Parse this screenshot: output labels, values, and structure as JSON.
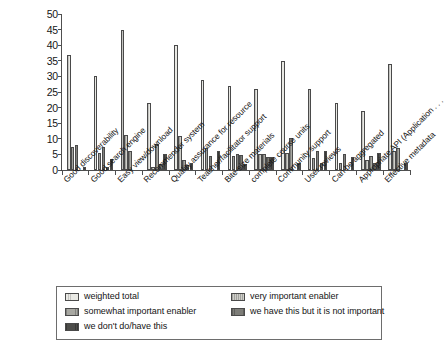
{
  "chart_data": {
    "type": "bar",
    "title": "",
    "subtitle": "",
    "xlabel": "",
    "ylabel": "",
    "ylim": [
      0,
      50
    ],
    "ytick_step": 5,
    "yticks": [
      0,
      5,
      10,
      15,
      20,
      25,
      30,
      35,
      40,
      45,
      50
    ],
    "ytick_labels": [
      "0",
      "5",
      "10",
      "15",
      "20",
      "25",
      "30",
      "35",
      "40",
      "45",
      "50"
    ],
    "grid": false,
    "legend_position": "bottom",
    "categories": [
      "Good discoverability",
      "Good search engine",
      "Easy view/download",
      "Recommender system",
      "Quality assurance for resource",
      "Teacher/facilitator support",
      "Bite-size materials",
      "complete course units",
      "Community support",
      "User reviews",
      "Can be aggregated",
      "Appropriate API (Application . . .",
      "Effective metadata"
    ],
    "series": [
      {
        "name": "weighted total",
        "color": "#e9e9e4",
        "values": [
          37,
          30,
          45,
          21.5,
          40,
          29,
          27,
          26,
          35,
          26,
          21.5,
          19,
          34
        ]
      },
      {
        "name": "very important enabler",
        "color": "#cfcfc9",
        "values": [
          7.5,
          5.3,
          11.3,
          1,
          10.8,
          7,
          4.5,
          5.2,
          5.3,
          4,
          2.3,
          3.2,
          6.2
        ]
      },
      {
        "name": "somewhat important enabler",
        "color": "#a8a8a2",
        "values": [
          8,
          7.4,
          6,
          8.2,
          3.3,
          4.5,
          5.2,
          5,
          10.2,
          6,
          5.2,
          4.5,
          7
        ]
      },
      {
        "name": "we have this but it is not important",
        "color": "#7d7d78",
        "values": [
          0,
          1,
          0,
          2,
          1.5,
          0,
          4.8,
          4.2,
          0,
          2.3,
          0,
          2.2,
          0
        ]
      },
      {
        "name": "we don't do/have this",
        "color": "#4d4d4a",
        "values": [
          1,
          3.5,
          0,
          5,
          2.2,
          6,
          2,
          4.3,
          2.2,
          6,
          4.2,
          5.3,
          2.2
        ]
      }
    ]
  },
  "legend": {
    "entries": [
      {
        "label": "weighted total",
        "color": "#e9e9e4"
      },
      {
        "label": "very important enabler",
        "color": "#cfcfc9"
      },
      {
        "label": "somewhat important enabler",
        "color": "#a8a8a2"
      },
      {
        "label": "we have this but it is not important",
        "color": "#7d7d78"
      },
      {
        "label": "we don't do/have this",
        "color": "#4d4d4a"
      }
    ]
  }
}
